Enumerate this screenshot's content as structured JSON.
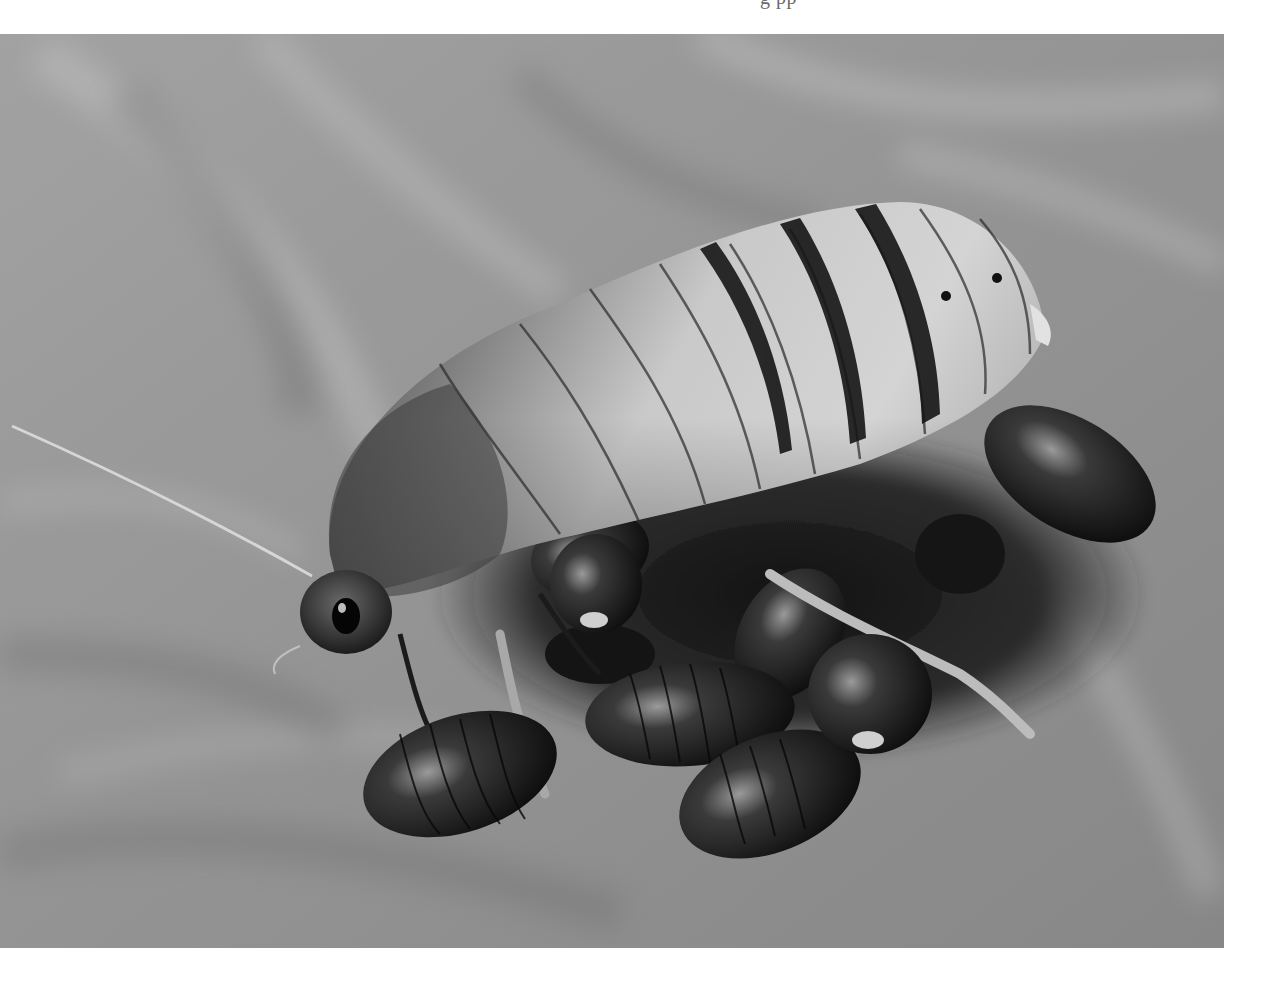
{
  "page": {
    "cutoff_caption": "g   pp",
    "background": "#ffffff"
  },
  "photo": {
    "subject": "Giant hissing cockroach with nymphs",
    "color_mode": "grayscale",
    "tones": {
      "surface_light": "#b4b4b4",
      "surface_mid": "#939393",
      "surface_dark": "#7a7a7a",
      "body_light": "#d8d8d8",
      "body_mid": "#a8a8a8",
      "body_dark": "#3a3a3a",
      "stripe": "#1a1a1a",
      "nymph": "#121212",
      "highlight": "#e6e6e6"
    }
  }
}
